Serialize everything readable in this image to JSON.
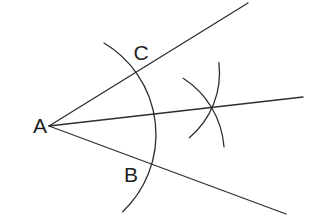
{
  "figure": {
    "kind": "angle-bisector-construction",
    "background_color": "#ffffff",
    "stroke_color": "#2d2d2d",
    "stroke_width": 1.3,
    "label_color": "#1f1f1f",
    "label_font_size": 21,
    "vertex": {
      "label": "A",
      "x": 49,
      "y": 126
    },
    "labels": [
      {
        "text": "A",
        "x": 40,
        "y": 133
      },
      {
        "text": "C",
        "x": 141,
        "y": 60
      },
      {
        "text": "B",
        "x": 131,
        "y": 182
      }
    ],
    "rays": [
      {
        "name": "ray-upper",
        "x1": 49,
        "y1": 126,
        "x2": 248,
        "y2": 3
      },
      {
        "name": "ray-bisector",
        "x1": 49,
        "y1": 126,
        "x2": 303,
        "y2": 97
      },
      {
        "name": "ray-lower",
        "x1": 49,
        "y1": 126,
        "x2": 286,
        "y2": 214
      }
    ],
    "arcs": [
      {
        "name": "compass-arc-main",
        "path": "M 104 43 A 106.4 106.4 0 0 1 122.7 211.7"
      },
      {
        "name": "compass-arc-from-c",
        "path": "M 218.9 62.7 A 84.5 84.5 0 0 1 189.3 137.7"
      },
      {
        "name": "compass-arc-from-b",
        "path": "M 183.2 78.3 A 89.1 89.1 0 0 1 224 146.8"
      }
    ]
  }
}
